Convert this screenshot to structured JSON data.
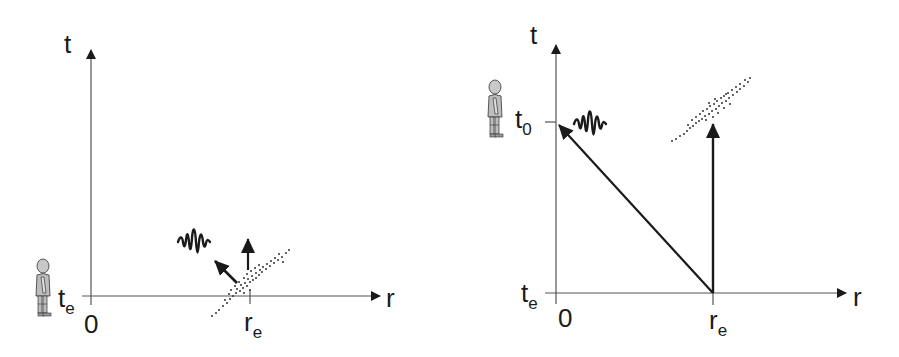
{
  "figure": {
    "panels": [
      {
        "id": "left",
        "description": "Emission event at (r_e, t_e): matter cloud moves up in time, light wave moves diagonally toward observer",
        "axes": {
          "y_label": "t",
          "x_label": "r",
          "origin_label": "0",
          "time_tick": {
            "main": "t",
            "sub": "e"
          },
          "space_tick": {
            "main": "r",
            "sub": "e"
          }
        },
        "elements": [
          "observer-figure",
          "light-wave",
          "diagonal-arrow",
          "vertical-arrow",
          "matter-cloud"
        ]
      },
      {
        "id": "right",
        "description": "Light reaches observer at r=0 at t_0; matter remains at r_e",
        "axes": {
          "y_label": "t",
          "x_label": "r",
          "origin_label": "0",
          "time_tick_low": {
            "main": "t",
            "sub": "e"
          },
          "time_tick_high": {
            "main": "t",
            "sub": "0"
          },
          "space_tick": {
            "main": "r",
            "sub": "e"
          }
        },
        "elements": [
          "observer-figure",
          "light-wave",
          "light-ray-arrow",
          "worldline-arrow",
          "matter-cloud"
        ]
      }
    ]
  },
  "colors": {
    "line": "#555555",
    "ink": "#1a1a1a",
    "figure_fill": "#bfbfbf"
  }
}
